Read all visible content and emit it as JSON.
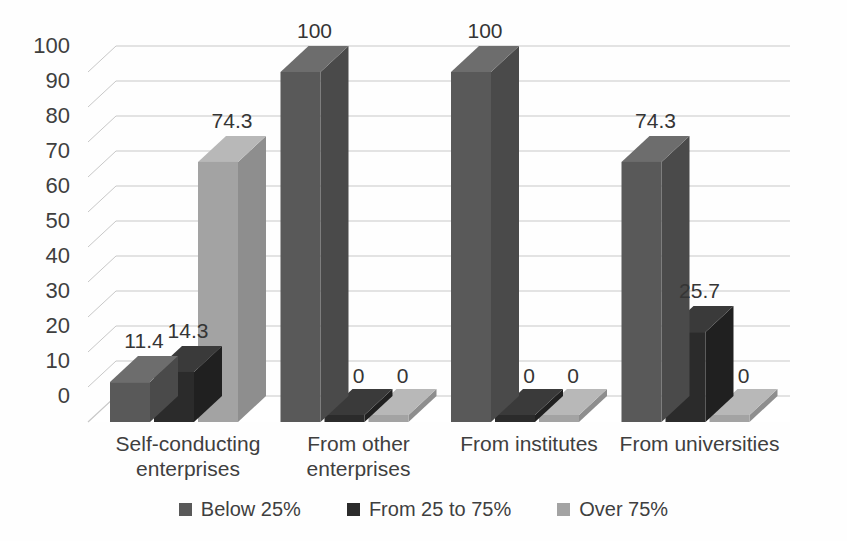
{
  "chart_data": {
    "type": "bar",
    "title": "",
    "subtitle": "",
    "xlabel": "",
    "ylabel": "",
    "ylim": [
      0,
      100
    ],
    "ytick_step": 10,
    "yticks": [
      "100",
      "90",
      "80",
      "70",
      "60",
      "50",
      "40",
      "30",
      "20",
      "10",
      "0"
    ],
    "grid": true,
    "three_d": true,
    "legend_position": "bottom",
    "categories": [
      "Self-conducting enterprises",
      "From other enterprises",
      "From institutes",
      "From universities"
    ],
    "category_lines": [
      [
        "Self-conducting",
        "enterprises"
      ],
      [
        "From other",
        "enterprises"
      ],
      [
        "From institutes"
      ],
      [
        "From universities"
      ]
    ],
    "series": [
      {
        "name": "Below 25%",
        "color": "#595959",
        "side_color": "#4a4a4a",
        "top_color": "#6d6d6d",
        "values": [
          11.4,
          100,
          100,
          74.3
        ],
        "labels": [
          "11.4",
          "100",
          "100",
          "74.3"
        ]
      },
      {
        "name": "From 25 to 75%",
        "color": "#2b2b2b",
        "side_color": "#202020",
        "top_color": "#3a3a3a",
        "values": [
          14.3,
          0,
          0,
          25.7
        ],
        "labels": [
          "14.3",
          "0",
          "0",
          "25.7"
        ]
      },
      {
        "name": "Over 75%",
        "color": "#a3a3a3",
        "side_color": "#8e8e8e",
        "top_color": "#b8b8b8",
        "values": [
          74.3,
          0,
          0,
          0
        ],
        "labels": [
          "74.3",
          "0",
          "0",
          "0"
        ]
      }
    ]
  },
  "legend": {
    "items": [
      {
        "label": "Below 25%",
        "color": "#595959"
      },
      {
        "label": "From 25 to 75%",
        "color": "#2b2b2b"
      },
      {
        "label": "Over 75%",
        "color": "#a3a3a3"
      }
    ]
  },
  "axes": {
    "y_tick_labels": [
      "100",
      "90",
      "80",
      "70",
      "60",
      "50",
      "40",
      "30",
      "20",
      "10",
      "0"
    ],
    "x_tick_labels": [
      "Self-conducting enterprises",
      "From other enterprises",
      "From institutes",
      "From universities"
    ]
  },
  "colors": {
    "background": "#fefefe",
    "gridline": "#c8c8c8",
    "text": "#3f3f3f",
    "floor": "#8a8a8a"
  }
}
